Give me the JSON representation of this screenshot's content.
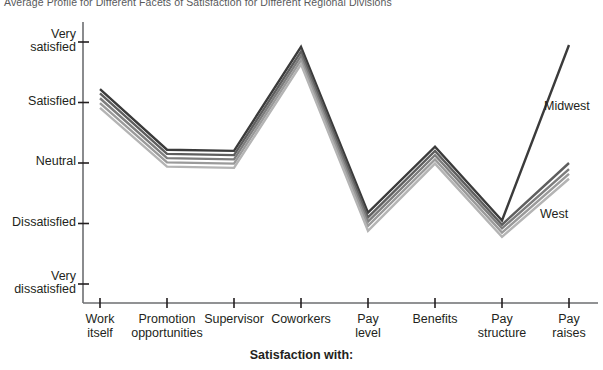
{
  "chart_data": {
    "type": "line",
    "title": "Average Profile for Different Facets of Satisfaction for Different Regional Divisions",
    "xlabel": "Satisfaction with:",
    "ylabel": "",
    "grid": false,
    "legend_position": "inline-right",
    "categories": [
      "Work itself",
      "Promotion opportunities",
      "Supervisor",
      "Coworkers",
      "Pay level",
      "Benefits",
      "Pay structure",
      "Pay raises"
    ],
    "category_lines": [
      [
        "Work",
        "itself"
      ],
      [
        "Promotion",
        "opportunities"
      ],
      [
        "Supervisor",
        ""
      ],
      [
        "Coworkers",
        ""
      ],
      [
        "Pay",
        "level"
      ],
      [
        "Benefits",
        ""
      ],
      [
        "Pay",
        "structure"
      ],
      [
        "Pay",
        "raises"
      ]
    ],
    "ytick_labels": [
      [
        "Very",
        "satisfied"
      ],
      [
        "Satisfied",
        ""
      ],
      [
        "Neutral",
        ""
      ],
      [
        "Dissatisfied",
        ""
      ],
      [
        "Very",
        "dissatisfied"
      ]
    ],
    "ytick_values": [
      5,
      4,
      3,
      2,
      1
    ],
    "ylim": [
      1,
      5
    ],
    "series": [
      {
        "name": "Midwest",
        "color": "#3b3b3b",
        "values": [
          4.22,
          3.22,
          3.2,
          4.92,
          2.18,
          3.27,
          2.05,
          4.95
        ]
      },
      {
        "name": "Series 2",
        "color": "#5e5e5e",
        "values": [
          4.15,
          3.15,
          3.13,
          4.84,
          2.1,
          3.2,
          1.98,
          3.0
        ]
      },
      {
        "name": "Series 3",
        "color": "#7d7d7d",
        "values": [
          4.07,
          3.08,
          3.06,
          4.77,
          2.03,
          3.13,
          1.92,
          2.9
        ]
      },
      {
        "name": "Series 4",
        "color": "#9a9a9a",
        "values": [
          3.99,
          3.01,
          2.99,
          4.7,
          1.96,
          3.06,
          1.85,
          2.82
        ]
      },
      {
        "name": "West",
        "color": "#b4b4b4",
        "values": [
          3.91,
          2.94,
          2.92,
          4.63,
          1.88,
          2.99,
          1.78,
          2.74
        ]
      }
    ],
    "annotations": [
      {
        "text": "Midwest",
        "x": 544,
        "y": 99
      },
      {
        "text": "West",
        "x": 540,
        "y": 207
      }
    ]
  }
}
